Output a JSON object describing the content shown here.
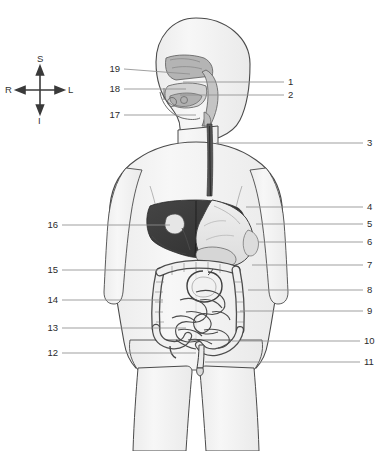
{
  "diagram": {
    "view": "anterior view of human torso with sagittal head section",
    "background_color": "#ffffff",
    "outline_color": "#4a4a4a",
    "body_fill_color": "#f4f4f4",
    "leader_line_color": "#8a8a8a",
    "label_text_color": "#2b2b2b"
  },
  "compass": {
    "name": "anatomical-orientation-indicator",
    "superior": "S",
    "inferior": "I",
    "right": "R",
    "left": "L",
    "center_x": 40,
    "center_y": 90
  },
  "labels": {
    "right_side": [
      {
        "id": "1",
        "text": "1",
        "y": 82,
        "text_x": 288,
        "line_from_x": 183,
        "line_from_y": 82,
        "line_to_x": 284
      },
      {
        "id": "2",
        "text": "2",
        "y": 95,
        "text_x": 288,
        "line_from_x": 180,
        "line_from_y": 95,
        "line_to_x": 284
      },
      {
        "id": "3",
        "text": "3",
        "y": 143,
        "text_x": 367,
        "line_from_x": 216,
        "line_from_y": 143,
        "line_to_x": 363
      },
      {
        "id": "4",
        "text": "4",
        "y": 207,
        "text_x": 367,
        "line_from_x": 246,
        "line_from_y": 207,
        "line_to_x": 363
      },
      {
        "id": "5",
        "text": "5",
        "y": 224,
        "text_x": 367,
        "line_from_x": 256,
        "line_from_y": 224,
        "line_to_x": 363
      },
      {
        "id": "6",
        "text": "6",
        "y": 242,
        "text_x": 367,
        "line_from_x": 258,
        "line_from_y": 242,
        "line_to_x": 363
      },
      {
        "id": "7",
        "text": "7",
        "y": 265,
        "text_x": 367,
        "line_from_x": 252,
        "line_from_y": 265,
        "line_to_x": 363
      },
      {
        "id": "8",
        "text": "8",
        "y": 290,
        "text_x": 367,
        "line_from_x": 248,
        "line_from_y": 290,
        "line_to_x": 363
      },
      {
        "id": "9",
        "text": "9",
        "y": 311,
        "text_x": 367,
        "line_from_x": 240,
        "line_from_y": 311,
        "line_to_x": 363
      },
      {
        "id": "10",
        "text": "10",
        "y": 341,
        "text_x": 364,
        "line_from_x": 232,
        "line_from_y": 341,
        "line_to_x": 360
      },
      {
        "id": "11",
        "text": "11",
        "y": 362,
        "text_x": 364,
        "line_from_x": 205,
        "line_from_y": 362,
        "line_to_x": 360
      }
    ],
    "left_side": [
      {
        "id": "12",
        "text": "12",
        "y": 353,
        "text_x": 48,
        "line_from_x": 62,
        "line_from_y": 353,
        "line_to_x": 196
      },
      {
        "id": "13",
        "text": "13",
        "y": 328,
        "text_x": 48,
        "line_from_x": 62,
        "line_from_y": 328,
        "line_to_x": 186
      },
      {
        "id": "14",
        "text": "14",
        "y": 300,
        "text_x": 48,
        "line_from_x": 62,
        "line_from_y": 300,
        "line_to_x": 163
      },
      {
        "id": "15",
        "text": "15",
        "y": 270,
        "text_x": 48,
        "line_from_x": 62,
        "line_from_y": 270,
        "line_to_x": 158
      },
      {
        "id": "16",
        "text": "16",
        "y": 225,
        "text_x": 48,
        "line_from_x": 62,
        "line_from_y": 225,
        "line_to_x": 170
      },
      {
        "id": "17",
        "text": "17",
        "y": 115,
        "text_x": 110,
        "line_from_x": 124,
        "line_from_y": 115,
        "line_to_x": 196
      },
      {
        "id": "18",
        "text": "18",
        "y": 89,
        "text_x": 110,
        "line_from_x": 124,
        "line_from_y": 89,
        "line_to_x": 186
      },
      {
        "id": "19",
        "text": "19",
        "y": 69,
        "text_x": 110,
        "line_from_x": 124,
        "line_from_y": 69,
        "line_to_x": 190
      }
    ]
  },
  "structures": {
    "liver": {
      "name": "liver",
      "fill": "#3a3a3a"
    },
    "gallbladder": {
      "name": "gallbladder",
      "fill": "#e8e8e8"
    },
    "stomach": {
      "name": "stomach",
      "fill": "#e4e4e4"
    },
    "esophagus": {
      "name": "esophagus",
      "fill": "#5a5a5a"
    },
    "small_intestine": {
      "name": "small-intestine",
      "fill": "#f0f0f0"
    },
    "large_intestine": {
      "name": "large-intestine",
      "fill": "#ededed"
    },
    "pancreas": {
      "name": "pancreas",
      "fill": "#d8d8d8"
    },
    "rectum": {
      "name": "rectum",
      "fill": "#ebebeb"
    },
    "oral_cavity": {
      "name": "oral-cavity",
      "fill": "#d0d0d0"
    },
    "nasal_cavity": {
      "name": "nasal-cavity",
      "fill": "#b8b8b8"
    },
    "pharynx": {
      "name": "pharynx",
      "fill": "#c6c6c6"
    }
  }
}
